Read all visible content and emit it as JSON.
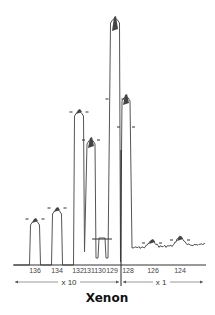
{
  "chart_data": {
    "type": "line",
    "title": "Xenon",
    "xlabel": "",
    "ylabel": "",
    "grid": false,
    "legend": null,
    "categories": [
      "136",
      "134",
      "132",
      "131",
      "130",
      "129",
      "128",
      "126",
      "124"
    ],
    "series": [
      {
        "name": "Xenon isotope signal (relative peak height, px from baseline)",
        "values": [
          46,
          57,
          155,
          126,
          27,
          246,
          170,
          25,
          28
        ]
      }
    ],
    "scale_regions": [
      {
        "label": "x 10",
        "isotopes": [
          "136",
          "134",
          "132",
          "131",
          "130",
          "129"
        ]
      },
      {
        "label": "x 1",
        "isotopes": [
          "128",
          "126",
          "124"
        ]
      }
    ],
    "peaks": [
      {
        "mass": "136",
        "x": 35,
        "top": 219,
        "tick": 219,
        "w": 9
      },
      {
        "mass": "134",
        "x": 57,
        "top": 208,
        "tick": 208,
        "w": 9
      },
      {
        "mass": "132",
        "x": 79,
        "top": 110,
        "tick": 112,
        "w": 9
      },
      {
        "mass": "131",
        "x": 91,
        "top": 138,
        "tick": 140,
        "w": 8
      },
      {
        "mass": "130",
        "x": 102,
        "top": 238,
        "tick": 239,
        "w": 10
      },
      {
        "mass": "129",
        "x": 115,
        "top": 17,
        "tick": 99,
        "w": 9
      },
      {
        "mass": "128",
        "x": 126,
        "top": 95,
        "tick": 127,
        "w": 8
      },
      {
        "mass": "126",
        "x": 152,
        "top": 240,
        "tick": 243,
        "w": 10
      },
      {
        "mass": "124",
        "x": 180,
        "top": 237,
        "tick": 240,
        "w": 10
      }
    ]
  },
  "axis": {
    "tick_labels": [
      {
        "text": "136",
        "x": 35
      },
      {
        "text": "134",
        "x": 57
      },
      {
        "text": "132",
        "x": 78
      },
      {
        "text": "131",
        "x": 89
      },
      {
        "text": "130",
        "x": 100
      },
      {
        "text": "129",
        "x": 112
      },
      {
        "text": "128",
        "x": 128
      },
      {
        "text": "126",
        "x": 153
      },
      {
        "text": "124",
        "x": 180
      }
    ]
  },
  "scales": {
    "left_label": "x 10",
    "right_label": "x 1"
  },
  "title": "Xenon",
  "colors": {
    "trace": "#555555",
    "axis": "#333333",
    "peak_cap": "#333333"
  }
}
